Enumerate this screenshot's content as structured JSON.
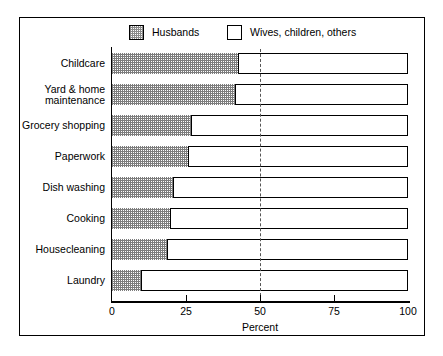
{
  "chart_data": {
    "type": "bar",
    "orientation": "horizontal",
    "stacked": true,
    "title": "",
    "xlabel": "Percent",
    "ylabel": "",
    "xlim": [
      0,
      100
    ],
    "xticks": [
      0,
      25,
      50,
      75,
      100
    ],
    "xticklabels": [
      "0",
      "25",
      "50",
      "75",
      "100"
    ],
    "grid": false,
    "legend_position": "top",
    "categories": [
      "Childcare",
      "Yard & home\nmaintenance",
      "Grocery shopping",
      "Paperwork",
      "Dish washing",
      "Cooking",
      "Housecleaning",
      "Laundry"
    ],
    "series": [
      {
        "name": "Husbands",
        "swatch": "hatch",
        "values": [
          43,
          42,
          27,
          26,
          21,
          20,
          19,
          10
        ]
      },
      {
        "name": "Wives, children, others",
        "swatch": "plain",
        "values": [
          57,
          58,
          73,
          74,
          79,
          80,
          81,
          90
        ]
      }
    ],
    "annotations": [
      {
        "type": "vline",
        "value": 50,
        "style": "dashed",
        "color": "#555555"
      }
    ]
  },
  "legend": {
    "entries": [
      {
        "label": "Husbands"
      },
      {
        "label": "Wives, children, others"
      }
    ]
  },
  "axis": {
    "title": "Percent",
    "ticklabels": [
      "0",
      "25",
      "50",
      "75",
      "100"
    ]
  }
}
